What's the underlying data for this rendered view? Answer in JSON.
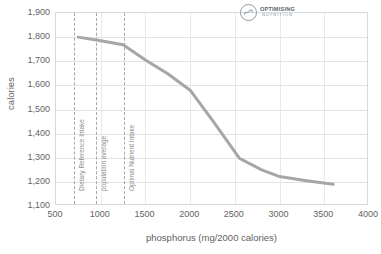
{
  "chart_data": {
    "type": "line",
    "title": "",
    "xlabel": "phosphorus (mg/2000 calories)",
    "ylabel": "calories",
    "xlim": [
      500,
      4000
    ],
    "ylim": [
      1100,
      1900
    ],
    "xticks": [
      "500",
      "1000",
      "1500",
      "2000",
      "2500",
      "3000",
      "3500",
      "4000"
    ],
    "yticks": [
      "1,900",
      "1,800",
      "1,700",
      "1,600",
      "1,500",
      "1,400",
      "1,300",
      "1,200",
      "1,100"
    ],
    "grid": true,
    "legend": "none",
    "series": [
      {
        "name": "calories",
        "color": "#a6a6a6",
        "x": [
          750,
          1000,
          1250,
          1500,
          1750,
          2000,
          2250,
          2550,
          2800,
          3000,
          3300,
          3600
        ],
        "y": [
          1800,
          1785,
          1768,
          1705,
          1648,
          1580,
          1455,
          1298,
          1250,
          1222,
          1205,
          1190
        ]
      }
    ],
    "reference_lines": [
      {
        "label": "Dietary Reference Intake",
        "x": 700
      },
      {
        "label": "population average",
        "x": 950
      },
      {
        "label": "Optimal Nutrient Intake",
        "x": 1260
      },
      {
        "label": "Upper Limit",
        "x": 4000
      }
    ]
  },
  "logo": {
    "title": "OPTIMISING",
    "subtitle": "NUTRITION"
  }
}
